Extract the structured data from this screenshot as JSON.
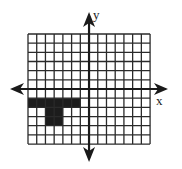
{
  "diagram": {
    "type": "coordinate-grid",
    "x_range": [
      -7,
      7
    ],
    "y_range": [
      -6,
      6
    ],
    "grid_step": 1,
    "axes": {
      "x_label": "x",
      "y_label": "y"
    },
    "colors": {
      "grid": "#2a2a2a",
      "axis": "#1a1a1a",
      "fill": "#1c1c1c",
      "background": "#ffffff"
    },
    "shaded_shape": {
      "name": "T-shape",
      "cells": [
        {
          "x0": -7,
          "y0": -2,
          "x1": -1,
          "y1": -1
        },
        {
          "x0": -5,
          "y0": -4,
          "x1": -3,
          "y1": -2
        }
      ]
    }
  },
  "layout_px": {
    "grid_left": 28,
    "grid_top": 34,
    "cell_w": 8.72,
    "cell_h": 9.17
  }
}
